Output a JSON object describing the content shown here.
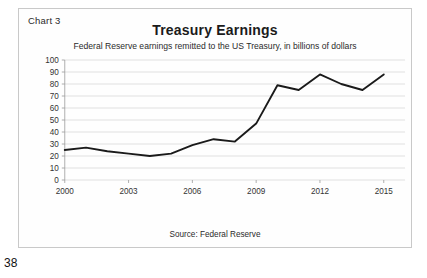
{
  "page": {
    "number": "38"
  },
  "figure": {
    "chart_label": "Chart 3",
    "title": "Treasury Earnings",
    "subtitle": "Federal Reserve earnings remitted to the US Treasury, in billions of dollars",
    "source": "Source: Federal Reserve"
  },
  "chart_data": {
    "type": "line",
    "title": "Treasury Earnings",
    "subtitle": "Federal Reserve earnings remitted to the US Treasury, in billions of dollars",
    "xlabel": "",
    "ylabel": "",
    "ylim": [
      0,
      100
    ],
    "xlim": [
      2000,
      2016
    ],
    "ytick_labels": [
      "0",
      "10",
      "20",
      "30",
      "40",
      "50",
      "60",
      "70",
      "80",
      "90",
      "100"
    ],
    "ytick_values": [
      0,
      10,
      20,
      30,
      40,
      50,
      60,
      70,
      80,
      90,
      100
    ],
    "xtick_labels": [
      "2000",
      "2003",
      "2006",
      "2009",
      "2012",
      "2015"
    ],
    "xtick_values": [
      2000,
      2003,
      2006,
      2009,
      2012,
      2015
    ],
    "grid": "horizontal",
    "legend": "none",
    "annotation": "Source: Federal Reserve",
    "series": [
      {
        "name": "Federal Reserve earnings remitted to the US Treasury",
        "color": "#1a1a1a",
        "x": [
          2000,
          2001,
          2002,
          2003,
          2004,
          2005,
          2006,
          2007,
          2008,
          2009,
          2010,
          2011,
          2012,
          2013,
          2014,
          2015
        ],
        "values": [
          25,
          27,
          24,
          22,
          20,
          22,
          29,
          34,
          32,
          47,
          79,
          75,
          88,
          80,
          75,
          88
        ]
      }
    ]
  }
}
